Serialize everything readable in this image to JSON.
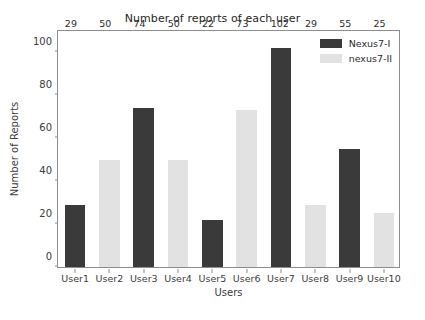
{
  "chart_data": {
    "type": "bar",
    "title": "Number of reports of each user",
    "xlabel": "Users",
    "ylabel": "Number of Reports",
    "categories": [
      "User1",
      "User2",
      "User3",
      "User4",
      "User5",
      "User6",
      "User7",
      "User8",
      "User9",
      "User10"
    ],
    "values": [
      29,
      50,
      74,
      50,
      22,
      73,
      102,
      29,
      55,
      25
    ],
    "bar_series": [
      "Nexus7-I",
      "nexus7-II",
      "Nexus7-I",
      "nexus7-II",
      "Nexus7-I",
      "nexus7-II",
      "Nexus7-I",
      "nexus7-II",
      "Nexus7-I",
      "nexus7-II"
    ],
    "ylim": [
      0,
      110
    ],
    "yticks": [
      0,
      20,
      40,
      60,
      80,
      100
    ],
    "ytick_labels": [
      "0",
      "20",
      "40",
      "60",
      "80",
      "100"
    ],
    "grid": false,
    "legend_position": "upper right",
    "legend": [
      {
        "label": "Nexus7-I",
        "color": "#3a3a3a"
      },
      {
        "label": "nexus7-II",
        "color": "#e2e2e2"
      }
    ],
    "colors": {
      "dark_bar": "#3a3a3a",
      "light_bar": "#e2e2e2",
      "axis": "#8d8d8d",
      "text": "#2b2b2b",
      "background": "#ffffff"
    }
  }
}
